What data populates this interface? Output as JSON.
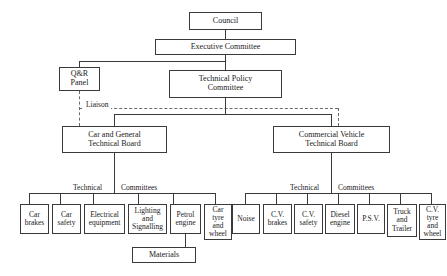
{
  "diagram": {
    "nodes": {
      "council": "Council",
      "executive_committee": "Executive Committee",
      "qr_panel": "Q&R\nPanel",
      "technical_policy_committee": "Technical Policy\nCommittee",
      "car_general_board": "Car and General\nTechnical Board",
      "commercial_vehicle_board": "Commercial Vehicle\nTechnical Board",
      "materials": "Materials"
    },
    "labels": {
      "liaison": "Liaison",
      "technical_left": "Technical",
      "committees_left": "Committees",
      "technical_right": "Technical",
      "committees_right": "Committees"
    },
    "car_committees": [
      "Car\nbrakes",
      "Car\nsafety",
      "Electrical\nequipment",
      "Lighting\nand\nSignalling",
      "Petrol\nengine",
      "Car\ntyre\nand\nwheel"
    ],
    "cv_committees": [
      "Noise",
      "C.V.\nbrakes",
      "C.V.\nsafety",
      "Diesel\nengine",
      "P.S.V.",
      "Truck\nand\nTrailer",
      "C.V.\ntyre\nand\nwheel"
    ],
    "colors": {
      "line": "#3a3a3a",
      "dashed_line": "#6a6a6a",
      "text": "#1a1a1a",
      "background": "#ffffff"
    }
  }
}
